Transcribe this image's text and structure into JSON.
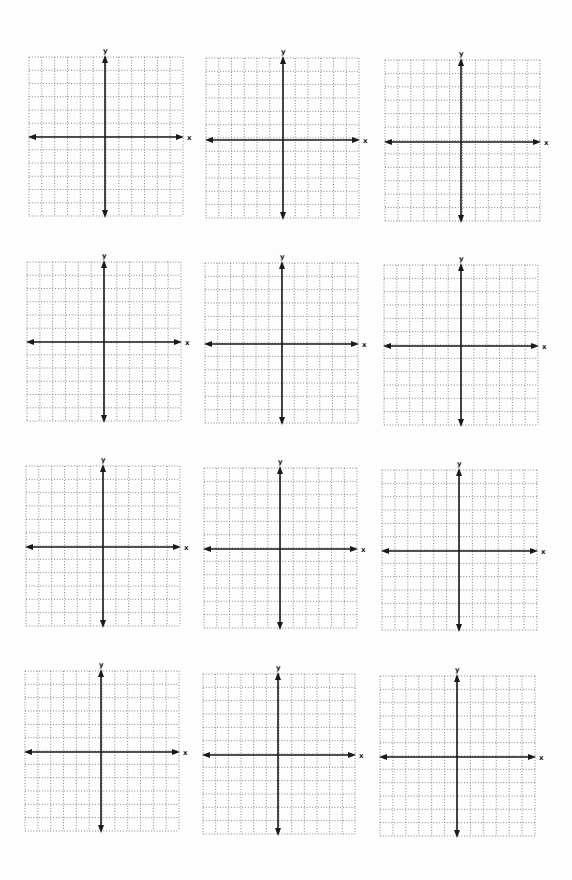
{
  "worksheet": {
    "title": "",
    "grid_rows": 12,
    "grid_cols": 12,
    "x_label": "x",
    "y_label": "y",
    "colors": {
      "axis": "#1a1a1a",
      "gridline": "#7a7a7a",
      "background": "#ffffff"
    }
  },
  "grids": [
    {
      "id": 1,
      "x": 29,
      "y": 57,
      "w": 154,
      "h": 159,
      "axis_x": 105,
      "axis_y": 137
    },
    {
      "id": 2,
      "x": 206,
      "y": 58,
      "w": 153,
      "h": 160,
      "axis_x": 283,
      "axis_y": 140
    },
    {
      "id": 3,
      "x": 385,
      "y": 60,
      "w": 155,
      "h": 161,
      "axis_x": 461,
      "axis_y": 142
    },
    {
      "id": 4,
      "x": 27,
      "y": 262,
      "w": 154,
      "h": 159,
      "axis_x": 104,
      "axis_y": 342
    },
    {
      "id": 5,
      "x": 205,
      "y": 263,
      "w": 153,
      "h": 160,
      "axis_x": 282,
      "axis_y": 344
    },
    {
      "id": 6,
      "x": 384,
      "y": 265,
      "w": 154,
      "h": 160,
      "axis_x": 461,
      "axis_y": 346
    },
    {
      "id": 7,
      "x": 26,
      "y": 466,
      "w": 154,
      "h": 160,
      "axis_x": 103,
      "axis_y": 547
    },
    {
      "id": 8,
      "x": 204,
      "y": 468,
      "w": 153,
      "h": 160,
      "axis_x": 280,
      "axis_y": 549
    },
    {
      "id": 9,
      "x": 382,
      "y": 470,
      "w": 155,
      "h": 160,
      "axis_x": 459,
      "axis_y": 551
    },
    {
      "id": 10,
      "x": 25,
      "y": 671,
      "w": 154,
      "h": 160,
      "axis_x": 101,
      "axis_y": 752
    },
    {
      "id": 11,
      "x": 203,
      "y": 674,
      "w": 152,
      "h": 160,
      "axis_x": 278,
      "axis_y": 755
    },
    {
      "id": 12,
      "x": 380,
      "y": 676,
      "w": 155,
      "h": 160,
      "axis_x": 457,
      "axis_y": 757
    }
  ]
}
